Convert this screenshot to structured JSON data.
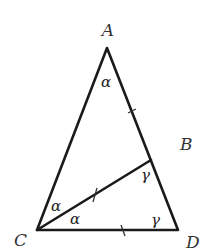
{
  "diagram": {
    "type": "geometry-triangle",
    "points": {
      "A": {
        "label": "A"
      },
      "B": {
        "label": "B"
      },
      "C": {
        "label": "C"
      },
      "D": {
        "label": "D"
      }
    },
    "segments": [
      "AC",
      "AD",
      "CD",
      "CB"
    ],
    "angles": {
      "A": "α",
      "ACB": "α",
      "BCD": "α",
      "CBD": "γ",
      "BDC": "γ"
    },
    "equal_marks": [
      "AB",
      "CB",
      "CD"
    ]
  }
}
